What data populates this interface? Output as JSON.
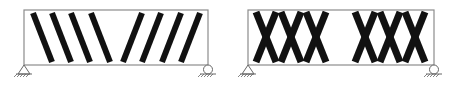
{
  "diagram": {
    "title": "",
    "background": "#ffffff",
    "colors": {
      "outline": "#8c8c8c",
      "crack": "#111111",
      "support": "#666666"
    },
    "beams": [
      {
        "id": "beam-shear-cracks",
        "pattern": "diagonal-shear-cracks",
        "box": {
          "x": 24,
          "y": 10,
          "w": 184,
          "h": 55
        },
        "cracks": [
          {
            "x1": 33,
            "y1": 13,
            "x2": 52,
            "y2": 62
          },
          {
            "x1": 52,
            "y1": 13,
            "x2": 71,
            "y2": 62
          },
          {
            "x1": 71,
            "y1": 13,
            "x2": 90,
            "y2": 62
          },
          {
            "x1": 91,
            "y1": 13,
            "x2": 110,
            "y2": 62
          },
          {
            "x1": 142,
            "y1": 13,
            "x2": 123,
            "y2": 62
          },
          {
            "x1": 161,
            "y1": 13,
            "x2": 142,
            "y2": 62
          },
          {
            "x1": 181,
            "y1": 13,
            "x2": 162,
            "y2": 62
          },
          {
            "x1": 200,
            "y1": 13,
            "x2": 181,
            "y2": 62
          }
        ],
        "supports": [
          {
            "type": "pin",
            "x": 24,
            "y": 65
          },
          {
            "type": "roller",
            "x": 208,
            "y": 65
          }
        ]
      },
      {
        "id": "beam-x-cracks",
        "pattern": "crossed-x-cracks",
        "box": {
          "x": 248,
          "y": 10,
          "w": 186,
          "h": 55
        },
        "cracks": [
          {
            "x1": 256,
            "y1": 12,
            "x2": 276,
            "y2": 62
          },
          {
            "x1": 276,
            "y1": 12,
            "x2": 256,
            "y2": 62
          },
          {
            "x1": 281,
            "y1": 12,
            "x2": 301,
            "y2": 62
          },
          {
            "x1": 301,
            "y1": 12,
            "x2": 281,
            "y2": 62
          },
          {
            "x1": 306,
            "y1": 12,
            "x2": 326,
            "y2": 62
          },
          {
            "x1": 326,
            "y1": 12,
            "x2": 306,
            "y2": 62
          },
          {
            "x1": 355,
            "y1": 12,
            "x2": 375,
            "y2": 62
          },
          {
            "x1": 375,
            "y1": 12,
            "x2": 355,
            "y2": 62
          },
          {
            "x1": 380,
            "y1": 12,
            "x2": 400,
            "y2": 62
          },
          {
            "x1": 400,
            "y1": 12,
            "x2": 380,
            "y2": 62
          },
          {
            "x1": 405,
            "y1": 12,
            "x2": 425,
            "y2": 62
          },
          {
            "x1": 425,
            "y1": 12,
            "x2": 405,
            "y2": 62
          }
        ],
        "supports": [
          {
            "type": "pin",
            "x": 248,
            "y": 65
          },
          {
            "type": "roller",
            "x": 434,
            "y": 65
          }
        ]
      }
    ]
  }
}
